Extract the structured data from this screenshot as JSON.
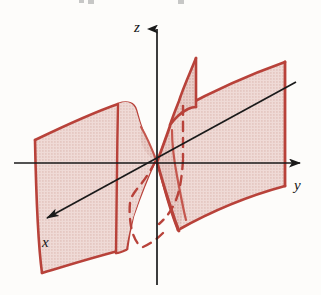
{
  "figure": {
    "kind": "3d-surface-plot",
    "canvas": {
      "width": 321,
      "height": 295
    },
    "colors": {
      "background": "#fdfcfa",
      "surface_fill": "#ead0cb",
      "surface_fill_dark": "#e0bfb9",
      "surface_outline": "#b8423a",
      "surface_outline_light": "#c4564d",
      "hidden_edge": "#b8423a",
      "axis": "#1a1a1a",
      "label": "#141414"
    }
  },
  "axes": {
    "origin": {
      "x": 157,
      "y": 163
    },
    "items": [
      {
        "id": "z",
        "label": "z",
        "direction": "up",
        "label_position": {
          "x": 138,
          "y": 27
        },
        "arrow_tip": {
          "x": 157,
          "y": 18
        },
        "line_start": {
          "x": 157,
          "y": 285
        },
        "line_end": {
          "x": 157,
          "y": 28
        }
      },
      {
        "id": "y",
        "label": "y",
        "direction": "right",
        "label_position": {
          "x": 297,
          "y": 186
        },
        "arrow_tip": {
          "x": 312,
          "y": 163
        },
        "line_start": {
          "x": 14,
          "y": 163
        },
        "line_end": {
          "x": 300,
          "y": 163
        }
      },
      {
        "id": "x",
        "label": "x",
        "direction": "down-left",
        "label_position": {
          "x": 47,
          "y": 243
        },
        "arrow_tip": {
          "x": 36,
          "y": 225
        },
        "line_start": {
          "x": 296,
          "y": 82
        },
        "line_end": {
          "x": 46,
          "y": 218
        }
      }
    ]
  },
  "surface": {
    "name": "twisted-surface",
    "sheets": [
      {
        "id": "left-sheet",
        "label": "lower-left sheet",
        "hidden_edges": 2
      },
      {
        "id": "right-sheet",
        "label": "upper-right sheet",
        "hidden_edges": 2
      },
      {
        "id": "center-twist",
        "label": "central twist fin",
        "hidden_edges": 1
      }
    ],
    "hatch": "halftone-dot"
  }
}
